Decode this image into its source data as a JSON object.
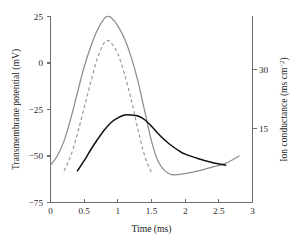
{
  "chart_data": {
    "type": "line",
    "title": "",
    "xlabel": "Time (ms)",
    "ylabel": "Transmembrane potential (mV)",
    "y2label": "Ion conductance (ms cm",
    "y2label_exponent": "−2",
    "y2label_tail": ")",
    "xlim": [
      0,
      3
    ],
    "ylim": [
      -75,
      25
    ],
    "y2lim": [
      0,
      37.5
    ],
    "grid": false,
    "legend": "none",
    "xticks": [
      0,
      0.5,
      1,
      1.5,
      2,
      2.5,
      3
    ],
    "xticklabels": [
      "0",
      "0.5",
      "1",
      "1.5",
      "2",
      "2.5",
      "3"
    ],
    "yticks": [
      25,
      0,
      -25,
      -50,
      -75
    ],
    "yticklabels": [
      "25",
      "0",
      "−25",
      "−50",
      "−75"
    ],
    "y2ticks": [
      30,
      15
    ],
    "y2ticklabels": [
      "30",
      "15"
    ],
    "series": [
      {
        "name": "action-potential-solid",
        "axis": "left",
        "style": "solid",
        "color": "#8d8d8d",
        "x": [
          0.0,
          0.1,
          0.2,
          0.3,
          0.4,
          0.5,
          0.6,
          0.7,
          0.8,
          0.85,
          0.9,
          1.0,
          1.1,
          1.2,
          1.3,
          1.4,
          1.5,
          1.6,
          1.7,
          1.8,
          1.9,
          2.0,
          2.2,
          2.4,
          2.6,
          2.8
        ],
        "y": [
          -55.0,
          -50.0,
          -42.0,
          -30.0,
          -16.0,
          -2.0,
          9.0,
          18.0,
          24.0,
          25.0,
          24.5,
          20.0,
          13.0,
          3.0,
          -10.0,
          -26.0,
          -42.0,
          -53.0,
          -58.0,
          -60.0,
          -60.0,
          -59.5,
          -58.0,
          -56.0,
          -54.0,
          -50.0
        ]
      },
      {
        "name": "action-potential-dashed",
        "axis": "left",
        "style": "dashed",
        "color": "#9a9a9a",
        "x": [
          0.2,
          0.3,
          0.4,
          0.5,
          0.6,
          0.7,
          0.8,
          0.85,
          0.9,
          1.0,
          1.1,
          1.2,
          1.3,
          1.4,
          1.5
        ],
        "y": [
          -58.0,
          -50.0,
          -38.0,
          -24.0,
          -10.0,
          3.0,
          11.0,
          12.0,
          11.0,
          5.0,
          -6.0,
          -20.0,
          -36.0,
          -50.0,
          -59.0
        ]
      },
      {
        "name": "ion-conductance-black",
        "axis": "right",
        "style": "solid",
        "color": "#111111",
        "x": [
          0.4,
          0.5,
          0.6,
          0.7,
          0.8,
          0.9,
          1.0,
          1.1,
          1.15,
          1.2,
          1.3,
          1.4,
          1.5,
          1.6,
          1.7,
          1.8,
          1.9,
          2.0,
          2.2,
          2.4,
          2.6
        ],
        "y_left_equiv": [
          -58.0,
          -52.5,
          -46.5,
          -41.0,
          -36.0,
          -32.0,
          -29.5,
          -28.0,
          -27.8,
          -28.0,
          -28.5,
          -30.5,
          -34.0,
          -38.0,
          -41.5,
          -44.5,
          -47.0,
          -49.0,
          -51.5,
          -53.5,
          -55.0
        ]
      }
    ]
  },
  "axes": {
    "x_title": "Time (ms)",
    "y_left_title": "Transmembrane potential (mV)",
    "y_right_title_main": "Ion conductance (ms cm",
    "y_right_title_sup": "−2",
    "y_right_title_end": ")"
  }
}
